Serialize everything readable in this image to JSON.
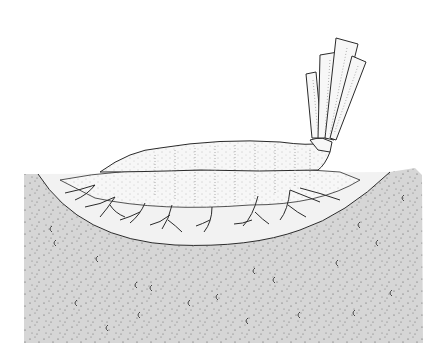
{
  "image": {
    "description": "Black-and-white line illustration of an elongated pale body lying in a shallow depression in stippled sediment, with a bundle of ribbon-like strands rising at the upper right and branching filaments extending into the sediment beneath.",
    "colors": {
      "background": "#ffffff",
      "ink": "#2a2a2a",
      "sediment": "#d9d9d9",
      "body_fill": "#f7f7f7"
    },
    "labels": []
  }
}
